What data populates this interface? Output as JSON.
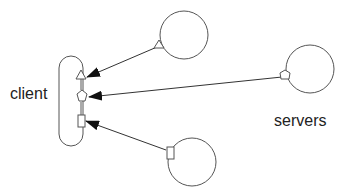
{
  "diagram": {
    "labels": {
      "client": "client",
      "servers": "servers"
    },
    "colors": {
      "stroke": "#555555",
      "arrowhead": "#111111",
      "text": "#222222",
      "background": "#ffffff"
    },
    "nodes": [
      {
        "id": "client",
        "shape": "rounded-pill",
        "ports": [
          "triangle",
          "pentagon",
          "rectangle"
        ]
      },
      {
        "id": "server-top",
        "shape": "circle",
        "port": "triangle"
      },
      {
        "id": "server-right",
        "shape": "circle",
        "port": "pentagon"
      },
      {
        "id": "server-bottom",
        "shape": "circle",
        "port": "rectangle"
      }
    ],
    "edges": [
      {
        "from": "server-top",
        "to": "client",
        "port": "triangle"
      },
      {
        "from": "server-right",
        "to": "client",
        "port": "pentagon"
      },
      {
        "from": "server-bottom",
        "to": "client",
        "port": "rectangle"
      }
    ]
  }
}
